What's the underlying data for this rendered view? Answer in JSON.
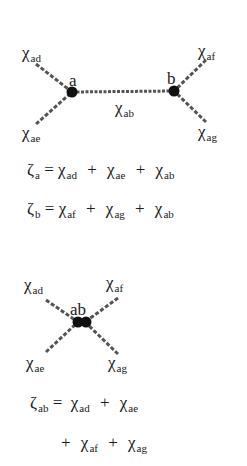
{
  "diagram1": {
    "nodes": [
      {
        "id": "a",
        "label": "a"
      },
      {
        "id": "b",
        "label": "b"
      }
    ],
    "edges": [
      {
        "sym": "χ",
        "sub": "ad"
      },
      {
        "sym": "χ",
        "sub": "ae"
      },
      {
        "sym": "χ",
        "sub": "ab"
      },
      {
        "sym": "χ",
        "sub": "af"
      },
      {
        "sym": "χ",
        "sub": "ag"
      }
    ],
    "equations": [
      {
        "lhs_sym": "ζ",
        "lhs_sub": "a",
        "eq": "=",
        "terms": [
          {
            "sym": "χ",
            "sub": "ad"
          },
          {
            "sym": "χ",
            "sub": "ae"
          },
          {
            "sym": "χ",
            "sub": "ab"
          }
        ],
        "plus": "+"
      },
      {
        "lhs_sym": "ζ",
        "lhs_sub": "b",
        "eq": "=",
        "terms": [
          {
            "sym": "χ",
            "sub": "af"
          },
          {
            "sym": "χ",
            "sub": "ag"
          },
          {
            "sym": "χ",
            "sub": "ab"
          }
        ],
        "plus": "+"
      }
    ]
  },
  "diagram2": {
    "node": {
      "label": "ab"
    },
    "edges": [
      {
        "sym": "χ",
        "sub": "ad"
      },
      {
        "sym": "χ",
        "sub": "af"
      },
      {
        "sym": "χ",
        "sub": "ae"
      },
      {
        "sym": "χ",
        "sub": "ag"
      }
    ],
    "equation": {
      "lhs_sym": "ζ",
      "lhs_sub": "ab",
      "eq": "=",
      "plus": "+",
      "line1": [
        {
          "sym": "χ",
          "sub": "ad"
        },
        {
          "sym": "χ",
          "sub": "ae"
        }
      ],
      "line2": [
        {
          "sym": "χ",
          "sub": "af"
        },
        {
          "sym": "χ",
          "sub": "ag"
        }
      ]
    }
  },
  "colors": {
    "ink": "#1a1a1a",
    "edge": "#555555",
    "background": "#ffffff"
  }
}
